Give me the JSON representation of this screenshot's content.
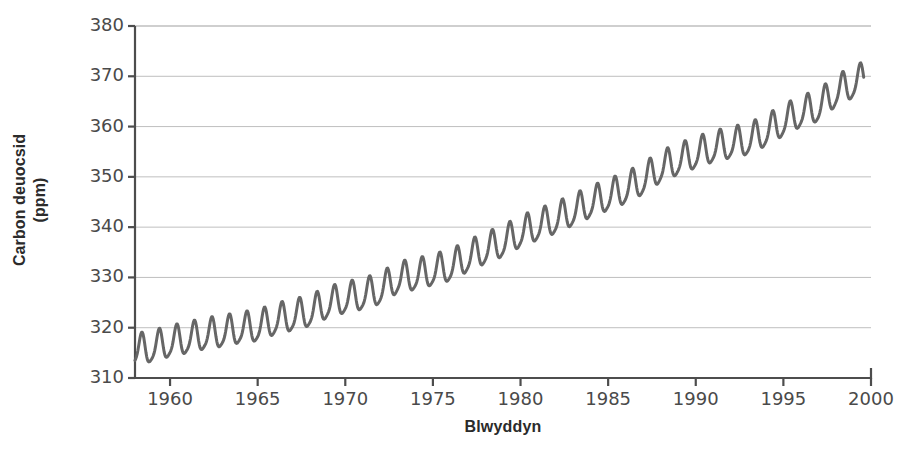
{
  "chart_data": {
    "type": "line",
    "title": "",
    "xlabel": "Blwyddyn",
    "ylabel": "Carbon deuocsid (ppm)",
    "ylabel_line1": "Carbon deuocsid",
    "ylabel_line2": "(ppm)",
    "xlim": [
      1958,
      2000
    ],
    "ylim": [
      310,
      380
    ],
    "xticks": [
      1960,
      1965,
      1970,
      1975,
      1980,
      1985,
      1990,
      1995,
      2000
    ],
    "xtick_labels": [
      "1960",
      "1965",
      "1970",
      "1975",
      "1980",
      "1985",
      "1990",
      "1995",
      "2000"
    ],
    "yticks": [
      310,
      320,
      330,
      340,
      350,
      360,
      370,
      380
    ],
    "ytick_labels": [
      "310",
      "320",
      "330",
      "340",
      "350",
      "360",
      "370",
      "380"
    ],
    "grid": true,
    "grid_axis": "y",
    "legend": null,
    "line_color": "#666666",
    "line_width": 3,
    "series": [
      {
        "name": "Carbon deuocsid atmosfferig (Mauna Loa)",
        "description": "Misol: cyfartaledd blynyddol cynyddol gyda chylchred dymhorol",
        "annual_mean": [
          {
            "year": 1958,
            "value": 315.3
          },
          {
            "year": 1959,
            "value": 315.9
          },
          {
            "year": 1960,
            "value": 316.9
          },
          {
            "year": 1961,
            "value": 317.6
          },
          {
            "year": 1962,
            "value": 318.4
          },
          {
            "year": 1963,
            "value": 318.9
          },
          {
            "year": 1964,
            "value": 319.6
          },
          {
            "year": 1965,
            "value": 320.0
          },
          {
            "year": 1966,
            "value": 321.3
          },
          {
            "year": 1967,
            "value": 322.1
          },
          {
            "year": 1968,
            "value": 323.0
          },
          {
            "year": 1969,
            "value": 324.6
          },
          {
            "year": 1970,
            "value": 325.6
          },
          {
            "year": 1971,
            "value": 326.3
          },
          {
            "year": 1972,
            "value": 327.4
          },
          {
            "year": 1973,
            "value": 329.6
          },
          {
            "year": 1974,
            "value": 330.2
          },
          {
            "year": 1975,
            "value": 331.1
          },
          {
            "year": 1976,
            "value": 332.0
          },
          {
            "year": 1977,
            "value": 333.8
          },
          {
            "year": 1978,
            "value": 335.4
          },
          {
            "year": 1979,
            "value": 336.8
          },
          {
            "year": 1980,
            "value": 338.7
          },
          {
            "year": 1981,
            "value": 340.1
          },
          {
            "year": 1982,
            "value": 341.4
          },
          {
            "year": 1983,
            "value": 343.0
          },
          {
            "year": 1984,
            "value": 344.6
          },
          {
            "year": 1985,
            "value": 346.0
          },
          {
            "year": 1986,
            "value": 347.4
          },
          {
            "year": 1987,
            "value": 349.2
          },
          {
            "year": 1988,
            "value": 351.6
          },
          {
            "year": 1989,
            "value": 353.1
          },
          {
            "year": 1990,
            "value": 354.4
          },
          {
            "year": 1991,
            "value": 355.6
          },
          {
            "year": 1992,
            "value": 356.4
          },
          {
            "year": 1993,
            "value": 357.1
          },
          {
            "year": 1994,
            "value": 358.8
          },
          {
            "year": 1995,
            "value": 360.8
          },
          {
            "year": 1996,
            "value": 362.6
          },
          {
            "year": 1997,
            "value": 363.7
          },
          {
            "year": 1998,
            "value": 366.7
          },
          {
            "year": 1999,
            "value": 368.4
          }
        ],
        "seasonal_amplitude": 3.0,
        "seasonal_peak_month": 5,
        "notes": "Brig tymhorol ym mis Mai, isafbwynt ym mis Medi-Hydref"
      }
    ]
  },
  "axes": {
    "y_axis_name": "carbon-dioxide-ppm",
    "x_axis_name": "year"
  }
}
